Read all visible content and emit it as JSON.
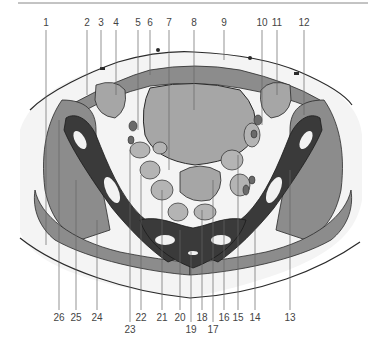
{
  "figure": {
    "type": "anatomical cross-section diagram (pelvis, axial)",
    "top_labels": [
      {
        "n": "1",
        "x": 46
      },
      {
        "n": "2",
        "x": 87
      },
      {
        "n": "3",
        "x": 101
      },
      {
        "n": "4",
        "x": 116
      },
      {
        "n": "5",
        "x": 138
      },
      {
        "n": "6",
        "x": 150
      },
      {
        "n": "7",
        "x": 169
      },
      {
        "n": "8",
        "x": 194
      },
      {
        "n": "9",
        "x": 224
      },
      {
        "n": "10",
        "x": 262
      },
      {
        "n": "11",
        "x": 277
      },
      {
        "n": "12",
        "x": 304
      }
    ],
    "bottom_labels": [
      {
        "n": "26",
        "x": 59,
        "row": 1
      },
      {
        "n": "25",
        "x": 76,
        "row": 1
      },
      {
        "n": "24",
        "x": 97,
        "row": 1
      },
      {
        "n": "23",
        "x": 130,
        "row": 2
      },
      {
        "n": "22",
        "x": 141,
        "row": 1
      },
      {
        "n": "21",
        "x": 162,
        "row": 1
      },
      {
        "n": "20",
        "x": 180,
        "row": 1
      },
      {
        "n": "19",
        "x": 191,
        "row": 2
      },
      {
        "n": "18",
        "x": 202,
        "row": 1
      },
      {
        "n": "17",
        "x": 213,
        "row": 2
      },
      {
        "n": "16",
        "x": 224,
        "row": 1
      },
      {
        "n": "15",
        "x": 238,
        "row": 1
      },
      {
        "n": "14",
        "x": 255,
        "row": 1
      },
      {
        "n": "13",
        "x": 290,
        "row": 1
      }
    ],
    "colors": {
      "bone": "#3a3a3a",
      "muscle": "#8c8c8c",
      "organ": "#a6a6a6",
      "light_organ": "#b4b4b4",
      "fat": "#f2f2f2",
      "outline": "#2a2a2a",
      "leader": "#666666"
    }
  }
}
